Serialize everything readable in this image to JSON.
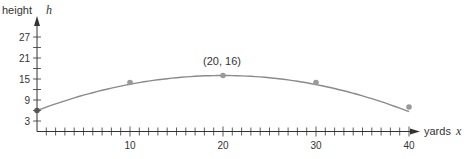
{
  "chart_data": {
    "type": "line",
    "title": "",
    "xlabel": "yards",
    "xvar": "x",
    "ylabel": "height",
    "yvar": "h",
    "x": [
      0,
      10,
      20,
      30,
      40
    ],
    "series": [
      {
        "name": "height",
        "values": [
          6,
          14,
          16,
          14,
          7
        ]
      }
    ],
    "annotations": [
      {
        "x": 20,
        "y": 16,
        "text": "(20, 16)"
      }
    ],
    "xticks": [
      10,
      20,
      30,
      40
    ],
    "yticks": [
      3,
      9,
      15,
      21,
      27
    ],
    "xlim": [
      0,
      42
    ],
    "ylim": [
      0,
      30
    ],
    "x_minor_step": 1,
    "y_minor_step": 3,
    "grid": false,
    "legend": null,
    "colors": {
      "curve": "#8a8a8a",
      "point": "#9a9a9a",
      "axis": "#333333"
    }
  },
  "labels": {
    "ylabel": "height",
    "yvar": "h",
    "xlabel": "yards",
    "xvar": "x",
    "vertex": "(20, 16)"
  }
}
